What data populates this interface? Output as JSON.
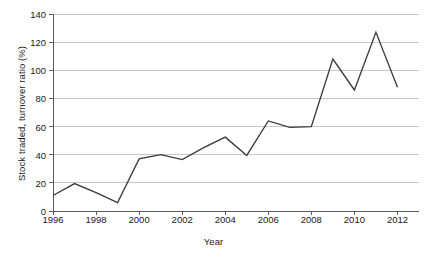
{
  "chart_data": {
    "type": "line",
    "title": "",
    "xlabel": "Year",
    "ylabel": "Stock traded, turnover ratio (%)",
    "x": [
      1996,
      1997,
      1998,
      1999,
      2000,
      2001,
      2002,
      2003,
      2004,
      2005,
      2006,
      2007,
      2008,
      2009,
      2010,
      2011,
      2012
    ],
    "values": [
      11,
      19.5,
      13,
      6,
      37,
      40,
      36.5,
      45,
      52.5,
      39.5,
      64,
      59.5,
      60,
      108,
      86,
      127,
      88
    ],
    "series": [
      {
        "name": "Stock traded, turnover ratio (%)",
        "values": [
          11,
          19.5,
          13,
          6,
          37,
          40,
          36.5,
          45,
          52.5,
          39.5,
          64,
          59.5,
          60,
          108,
          86,
          127,
          88
        ]
      }
    ],
    "xlim": [
      1996,
      2013
    ],
    "ylim": [
      0,
      140
    ],
    "xticks": [
      1996,
      1998,
      2000,
      2002,
      2004,
      2006,
      2008,
      2010,
      2012
    ],
    "xtick_labels": [
      "1996",
      "1998",
      "2000",
      "2002",
      "2004",
      "2006",
      "2008",
      "2010",
      "2012"
    ],
    "yticks": [
      0,
      20,
      40,
      60,
      80,
      100,
      120,
      140
    ],
    "ytick_labels": [
      "0",
      "20",
      "40",
      "60",
      "80",
      "100",
      "120",
      "140"
    ],
    "grid": "horizontal",
    "legend": "none",
    "line_color": "#3a3a3a",
    "grid_color": "#c8c8c8",
    "axis_color": "#5a5a5a",
    "background_color": "#ffffff"
  }
}
